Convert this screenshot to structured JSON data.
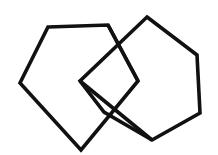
{
  "figure": {
    "background_color": "#ffffff",
    "stroke_color": "#111111",
    "stroke_width": 3.6,
    "canvas": {
      "width": 218,
      "height": 155
    },
    "shapes": [
      {
        "name": "pentagon-left",
        "label": "Pentagon",
        "sides": 5,
        "closed": true,
        "points": "48,27 108,25 138,81 81,150 20,83"
      },
      {
        "name": "hexagon-right",
        "label": "Hexagon",
        "sides": 6,
        "closed": true,
        "points": "147,17 197,55 200,113 152,140 104,112 80,81"
      }
    ],
    "crossings": [
      {
        "name": "crossing-upper",
        "x": 118,
        "y": 47
      },
      {
        "name": "crossing-lower",
        "x": 113,
        "y": 112
      }
    ]
  }
}
